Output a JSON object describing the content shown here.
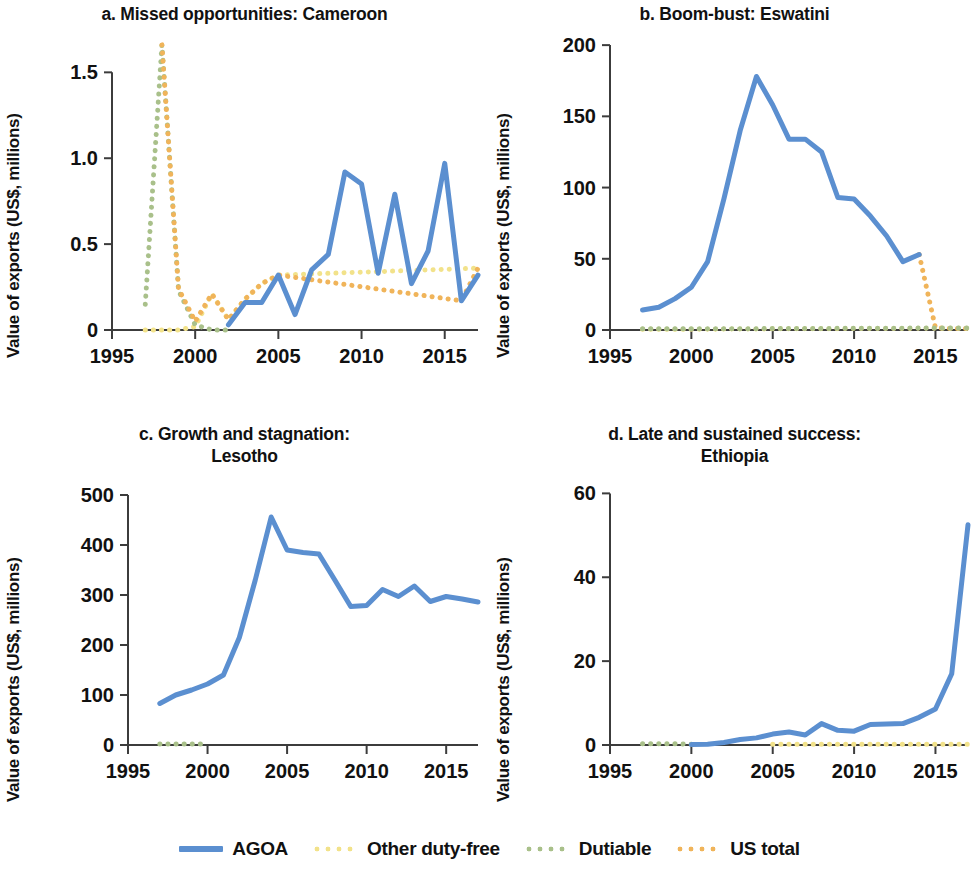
{
  "figure": {
    "y_axis_label": "Value of exports (US$, millions)"
  },
  "legend": {
    "items": [
      {
        "label": "AGOA",
        "color": "#5B8FD0",
        "style": "solid"
      },
      {
        "label": "Other duty-free",
        "color": "#F2E28A",
        "style": "dotted"
      },
      {
        "label": "Dutiable",
        "color": "#A9C08A",
        "style": "dotted"
      },
      {
        "label": "US total",
        "color": "#F0B45A",
        "style": "dotted"
      }
    ]
  },
  "chart_data": [
    {
      "type": "line",
      "panel": "a",
      "title": "a. Missed opportunities: Cameroon",
      "xlabel": "",
      "ylabel": "Value of exports (US$, millions)",
      "xlim": [
        1995,
        2017
      ],
      "ylim": [
        0,
        1.7
      ],
      "xticks": [
        1995,
        2000,
        2005,
        2010,
        2015
      ],
      "yticks": [
        0,
        0.5,
        1.0,
        1.5
      ],
      "ytick_labels": [
        "0",
        "0.5",
        "1.0",
        "1.5"
      ],
      "grid": false,
      "legend_position": "bottom-figure",
      "series": [
        {
          "name": "AGOA",
          "color": "#5B8FD0",
          "style": "solid",
          "x": [
            2002,
            2003,
            2004,
            2005,
            2006,
            2007,
            2008,
            2009,
            2010,
            2011,
            2012,
            2013,
            2014,
            2015,
            2016,
            2017
          ],
          "values": [
            0.03,
            0.16,
            0.16,
            0.32,
            0.09,
            0.35,
            0.44,
            0.92,
            0.85,
            0.33,
            0.79,
            0.27,
            0.46,
            0.97,
            0.17,
            0.32
          ]
        },
        {
          "name": "Other duty-free",
          "color": "#F2E28A",
          "style": "dotted",
          "x": [
            1997,
            1998,
            1999,
            2000,
            2001,
            2002,
            2003,
            2004,
            2005,
            2017
          ],
          "values": [
            0.0,
            0.0,
            0.0,
            0.02,
            0.21,
            0.06,
            0.18,
            0.27,
            0.32,
            0.36
          ]
        },
        {
          "name": "Dutiable",
          "color": "#A9C08A",
          "style": "dotted",
          "x": [
            1997,
            1998,
            1999,
            2000,
            2001,
            2002
          ],
          "values": [
            0.15,
            1.66,
            0.23,
            0.03,
            0.0,
            0.0
          ]
        },
        {
          "name": "US total",
          "color": "#F0B45A",
          "style": "dotted",
          "x": [
            1998,
            1999,
            2000,
            2001,
            2002,
            2003,
            2004,
            2005,
            2016,
            2017
          ],
          "values": [
            1.66,
            0.24,
            0.05,
            0.21,
            0.06,
            0.18,
            0.27,
            0.32,
            0.17,
            0.36
          ]
        }
      ]
    },
    {
      "type": "line",
      "panel": "b",
      "title": "b. Boom-bust: Eswatini",
      "xlabel": "",
      "ylabel": "Value of exports (US$, millions)",
      "xlim": [
        1995,
        2017
      ],
      "ylim": [
        0,
        205
      ],
      "xticks": [
        1995,
        2000,
        2005,
        2010,
        2015
      ],
      "yticks": [
        0,
        50,
        100,
        150,
        200
      ],
      "ytick_labels": [
        "0",
        "50",
        "100",
        "150",
        "200"
      ],
      "grid": false,
      "legend_position": "bottom-figure",
      "series": [
        {
          "name": "AGOA",
          "color": "#5B8FD0",
          "style": "solid",
          "x": [
            1997,
            1998,
            1999,
            2000,
            2001,
            2002,
            2003,
            2004,
            2005,
            2006,
            2007,
            2008,
            2009,
            2010,
            2011,
            2012,
            2013,
            2014
          ],
          "values": [
            14,
            16,
            22,
            30,
            48,
            92,
            140,
            178,
            158,
            134,
            134,
            125,
            93,
            92,
            80,
            66,
            48,
            53
          ]
        },
        {
          "name": "US total",
          "color": "#F0B45A",
          "style": "dotted",
          "x": [
            2014,
            2015,
            2016,
            2017
          ],
          "values": [
            53,
            1.5,
            1,
            1
          ]
        },
        {
          "name": "Other duty-free",
          "color": "#F2E28A",
          "style": "dotted",
          "x": [
            1997,
            2000,
            2005,
            2010,
            2015,
            2017
          ],
          "values": [
            0.5,
            0.5,
            0.8,
            1.0,
            1.2,
            1.2
          ]
        },
        {
          "name": "Dutiable",
          "color": "#A9C08A",
          "style": "dotted",
          "x": [
            1997,
            2000,
            2005,
            2010,
            2015,
            2017
          ],
          "values": [
            0.8,
            0.8,
            1.0,
            1.2,
            1.4,
            1.4
          ]
        }
      ]
    },
    {
      "type": "line",
      "panel": "c",
      "title_line1": "c. Growth and stagnation:",
      "title_line2": "Lesotho",
      "title": "c. Growth and stagnation: Lesotho",
      "xlabel": "",
      "ylabel": "Value of exports (US$, millions)",
      "xlim": [
        1995,
        2017
      ],
      "ylim": [
        0,
        520
      ],
      "xticks": [
        1995,
        2000,
        2005,
        2010,
        2015
      ],
      "yticks": [
        0,
        100,
        200,
        300,
        400,
        500
      ],
      "ytick_labels": [
        "0",
        "100",
        "200",
        "300",
        "400",
        "500"
      ],
      "grid": false,
      "legend_position": "bottom-figure",
      "series": [
        {
          "name": "AGOA",
          "color": "#5B8FD0",
          "style": "solid",
          "x": [
            1997,
            1998,
            1999,
            2000,
            2001,
            2002,
            2003,
            2004,
            2005,
            2006,
            2007,
            2008,
            2009,
            2010,
            2011,
            2012,
            2013,
            2014,
            2015,
            2016,
            2017
          ],
          "values": [
            83,
            100,
            110,
            122,
            140,
            215,
            330,
            456,
            390,
            385,
            382,
            330,
            277,
            279,
            311,
            297,
            318,
            287,
            297,
            292,
            286
          ]
        },
        {
          "name": "Dutiable",
          "color": "#A9C08A",
          "style": "dotted",
          "x": [
            1997,
            1998,
            1999,
            2000
          ],
          "values": [
            2,
            2,
            2,
            2
          ]
        }
      ]
    },
    {
      "type": "line",
      "panel": "d",
      "title_line1": "d. Late and sustained success:",
      "title_line2": "Ethiopia",
      "title": "d. Late and sustained success: Ethiopia",
      "xlabel": "",
      "ylabel": "Value of exports (US$, millions)",
      "xlim": [
        1995,
        2017
      ],
      "ylim": [
        0,
        62
      ],
      "xticks": [
        1995,
        2000,
        2005,
        2010,
        2015
      ],
      "yticks": [
        0,
        20,
        40,
        60
      ],
      "ytick_labels": [
        "0",
        "20",
        "40",
        "60"
      ],
      "grid": false,
      "legend_position": "bottom-figure",
      "series": [
        {
          "name": "AGOA",
          "color": "#5B8FD0",
          "style": "solid",
          "x": [
            2000,
            2001,
            2002,
            2003,
            2004,
            2005,
            2006,
            2007,
            2008,
            2009,
            2010,
            2011,
            2012,
            2013,
            2014,
            2015,
            2016,
            2017
          ],
          "values": [
            0.1,
            0.2,
            0.6,
            1.3,
            1.7,
            2.6,
            3.1,
            2.4,
            5.1,
            3.5,
            3.3,
            4.9,
            5.0,
            5.1,
            6.6,
            8.6,
            17.0,
            52.5
          ]
        },
        {
          "name": "Dutiable",
          "color": "#A9C08A",
          "style": "dotted",
          "x": [
            1997,
            1998,
            1999,
            2000
          ],
          "values": [
            0.3,
            0.3,
            0.3,
            0.2
          ]
        },
        {
          "name": "Other duty-free",
          "color": "#F2E28A",
          "style": "dotted",
          "x": [
            2005,
            2008,
            2011,
            2014,
            2016,
            2017
          ],
          "values": [
            0.2,
            0.2,
            0.2,
            0.2,
            0.2,
            0.2
          ]
        }
      ]
    }
  ]
}
